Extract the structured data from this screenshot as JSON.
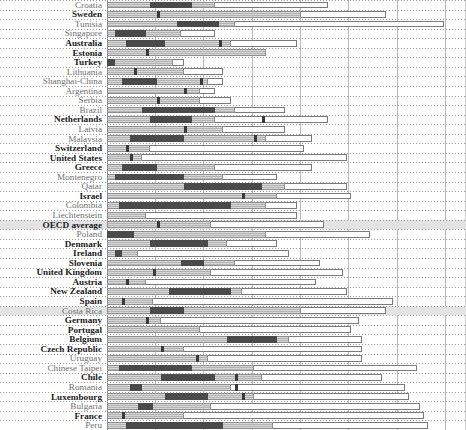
{
  "chart_data": {
    "type": "bar",
    "title": "",
    "subtitle": "",
    "xlabel": "",
    "ylabel": "",
    "orientation": "horizontal",
    "stacked": true,
    "grid": {
      "vertical": true,
      "horizontal": true
    },
    "legend": {
      "position": "none",
      "entries": []
    },
    "xlim": [
      0,
      100
    ],
    "xticks": [
      0,
      12.5,
      25,
      37.5,
      50,
      62.5,
      75,
      87.5
    ],
    "xticklabels": [
      "",
      "",
      "",
      "",
      "",
      "",
      "",
      ""
    ],
    "series": [
      {
        "name": "filled-portion",
        "color": "#b4b4b4"
      },
      {
        "name": "dark-segment",
        "color": "#4a4a4a"
      },
      {
        "name": "outlined-total",
        "color": "#ffffff"
      }
    ],
    "categories": [
      "Croatia",
      "Sweden",
      "Tunisia",
      "Singapore",
      "Australia",
      "Estonia",
      "Turkey",
      "Lithuania",
      "Shanghai-China",
      "Argentina",
      "Serbia",
      "Brazil",
      "Netherlands",
      "Latvia",
      "Malaysia",
      "Switzerland",
      "United States",
      "Greece",
      "Montenegro",
      "Qatar",
      "Israel",
      "Colombia",
      "Liechtenstein",
      "OECD average",
      "Poland",
      "Denmark",
      "Ireland",
      "Slovenia",
      "United Kingdom",
      "Austria",
      "New Zealand",
      "Spain",
      "Costa Rica",
      "Germany",
      "Portugal",
      "Belgium",
      "Czech Republic",
      "Uruguay",
      "Chinese Taipei",
      "Chile",
      "Romania",
      "Luxembourg",
      "Bulgaria",
      "France",
      "Peru"
    ],
    "rows": [
      {
        "label": "Croatia",
        "bold": false,
        "highlight": false,
        "total": 57,
        "fill": 28,
        "seg_start": 11,
        "seg_end": 22,
        "marker": null
      },
      {
        "label": "Sweden",
        "bold": true,
        "highlight": false,
        "total": 72,
        "fill": 50,
        "seg_start": 0,
        "seg_end": 0,
        "marker": 13
      },
      {
        "label": "Tunisia",
        "bold": false,
        "highlight": false,
        "total": 87,
        "fill": 33,
        "seg_start": 18,
        "seg_end": 29,
        "marker": null
      },
      {
        "label": "Singapore",
        "bold": false,
        "highlight": false,
        "total": 28,
        "fill": 19,
        "seg_start": 2,
        "seg_end": 10,
        "marker": null
      },
      {
        "label": "Australia",
        "bold": true,
        "highlight": false,
        "total": 49,
        "fill": 32,
        "seg_start": 5,
        "seg_end": 15,
        "marker": 29
      },
      {
        "label": "Estonia",
        "bold": true,
        "highlight": false,
        "total": 41,
        "fill": 41,
        "seg_start": 0,
        "seg_end": 0,
        "marker": 10
      },
      {
        "label": "Turkey",
        "bold": true,
        "highlight": false,
        "total": 20,
        "fill": 17,
        "seg_start": 0,
        "seg_end": 2,
        "marker": null
      },
      {
        "label": "Lithuania",
        "bold": false,
        "highlight": false,
        "total": 30,
        "fill": 20,
        "seg_start": 0,
        "seg_end": 0,
        "marker": 7
      },
      {
        "label": "Shanghai-China",
        "bold": false,
        "highlight": false,
        "total": 30,
        "fill": 26,
        "seg_start": 4,
        "seg_end": 13,
        "marker": 24
      },
      {
        "label": "Argentina",
        "bold": false,
        "highlight": false,
        "total": 28,
        "fill": 24,
        "seg_start": 0,
        "seg_end": 0,
        "marker": 20
      },
      {
        "label": "Serbia",
        "bold": false,
        "highlight": false,
        "total": 32,
        "fill": 24,
        "seg_start": 0,
        "seg_end": 0,
        "marker": 13
      },
      {
        "label": "Brazil",
        "bold": false,
        "highlight": false,
        "total": 46,
        "fill": 33,
        "seg_start": 9,
        "seg_end": 28,
        "marker": null
      },
      {
        "label": "Netherlands",
        "bold": true,
        "highlight": false,
        "total": 57,
        "fill": 28,
        "seg_start": 11,
        "seg_end": 22,
        "marker": 40
      },
      {
        "label": "Latvia",
        "bold": false,
        "highlight": false,
        "total": 46,
        "fill": 30,
        "seg_start": 0,
        "seg_end": 0,
        "marker": 20
      },
      {
        "label": "Malaysia",
        "bold": false,
        "highlight": false,
        "total": 53,
        "fill": 41,
        "seg_start": 6,
        "seg_end": 20,
        "marker": 38
      },
      {
        "label": "Switzerland",
        "bold": true,
        "highlight": false,
        "total": 51,
        "fill": 11,
        "seg_start": 0,
        "seg_end": 0,
        "marker": 5
      },
      {
        "label": "United States",
        "bold": true,
        "highlight": false,
        "total": 62,
        "fill": 9,
        "seg_start": 0,
        "seg_end": 0,
        "marker": 6
      },
      {
        "label": "Greece",
        "bold": true,
        "highlight": false,
        "total": 53,
        "fill": 28,
        "seg_start": 4,
        "seg_end": 13,
        "marker": null
      },
      {
        "label": "Montenegro",
        "bold": false,
        "highlight": false,
        "total": 44,
        "fill": 30,
        "seg_start": 2,
        "seg_end": 20,
        "marker": null
      },
      {
        "label": "Qatar",
        "bold": false,
        "highlight": false,
        "total": 62,
        "fill": 46,
        "seg_start": 20,
        "seg_end": 40,
        "marker": null
      },
      {
        "label": "Israel",
        "bold": true,
        "highlight": false,
        "total": 63,
        "fill": 44,
        "seg_start": 0,
        "seg_end": 0,
        "marker": 35
      },
      {
        "label": "Colombia",
        "bold": false,
        "highlight": false,
        "total": 49,
        "fill": 41,
        "seg_start": 3,
        "seg_end": 32,
        "marker": null
      },
      {
        "label": "Liechtenstein",
        "bold": false,
        "highlight": false,
        "total": 49,
        "fill": 10,
        "seg_start": 0,
        "seg_end": 0,
        "marker": null
      },
      {
        "label": "OECD average",
        "bold": true,
        "highlight": true,
        "total": 56,
        "fill": 27,
        "seg_start": 0,
        "seg_end": 0,
        "marker": 13
      },
      {
        "label": "Poland",
        "bold": false,
        "highlight": false,
        "total": 68,
        "fill": 41,
        "seg_start": 0,
        "seg_end": 7,
        "marker": null
      },
      {
        "label": "Denmark",
        "bold": true,
        "highlight": false,
        "total": 44,
        "fill": 31,
        "seg_start": 11,
        "seg_end": 26,
        "marker": null
      },
      {
        "label": "Ireland",
        "bold": true,
        "highlight": false,
        "total": 47,
        "fill": 8,
        "seg_start": 2,
        "seg_end": 4,
        "marker": null
      },
      {
        "label": "Slovenia",
        "bold": true,
        "highlight": false,
        "total": 55,
        "fill": 33,
        "seg_start": 19,
        "seg_end": 25,
        "marker": null
      },
      {
        "label": "United Kingdom",
        "bold": true,
        "highlight": false,
        "total": 61,
        "fill": 27,
        "seg_start": 0,
        "seg_end": 0,
        "marker": 12
      },
      {
        "label": "Austria",
        "bold": true,
        "highlight": false,
        "total": 54,
        "fill": 10,
        "seg_start": 0,
        "seg_end": 0,
        "marker": 5
      },
      {
        "label": "New Zealand",
        "bold": true,
        "highlight": false,
        "total": 62,
        "fill": 35,
        "seg_start": 16,
        "seg_end": 32,
        "marker": null
      },
      {
        "label": "Spain",
        "bold": true,
        "highlight": false,
        "total": 74,
        "fill": 12,
        "seg_start": 0,
        "seg_end": 0,
        "marker": 4
      },
      {
        "label": "Costa Rica",
        "bold": false,
        "highlight": true,
        "total": 72,
        "fill": 50,
        "seg_start": 11,
        "seg_end": 20,
        "marker": null
      },
      {
        "label": "Germany",
        "bold": true,
        "highlight": false,
        "total": 65,
        "fill": 14,
        "seg_start": 0,
        "seg_end": 0,
        "marker": 10
      },
      {
        "label": "Portugal",
        "bold": true,
        "highlight": false,
        "total": 63,
        "fill": 24,
        "seg_start": 0,
        "seg_end": 0,
        "marker": null
      },
      {
        "label": "Belgium",
        "bold": true,
        "highlight": false,
        "total": 66,
        "fill": 47,
        "seg_start": 31,
        "seg_end": 44,
        "marker": null
      },
      {
        "label": "Czech Republic",
        "bold": true,
        "highlight": false,
        "total": 66,
        "fill": 20,
        "seg_start": 0,
        "seg_end": 0,
        "marker": 14
      },
      {
        "label": "Uruguay",
        "bold": false,
        "highlight": false,
        "total": 66,
        "fill": 26,
        "seg_start": 0,
        "seg_end": 0,
        "marker": 23
      },
      {
        "label": "Chinese Taipei",
        "bold": false,
        "highlight": false,
        "total": 80,
        "fill": 38,
        "seg_start": 3,
        "seg_end": 22,
        "marker": null
      },
      {
        "label": "Chile",
        "bold": true,
        "highlight": false,
        "total": 71,
        "fill": 40,
        "seg_start": 14,
        "seg_end": 28,
        "marker": 33
      },
      {
        "label": "Romania",
        "bold": false,
        "highlight": false,
        "total": 77,
        "fill": 32,
        "seg_start": 6,
        "seg_end": 9,
        "marker": 33
      },
      {
        "label": "Luxembourg",
        "bold": true,
        "highlight": false,
        "total": 78,
        "fill": 38,
        "seg_start": 15,
        "seg_end": 26,
        "marker": 35
      },
      {
        "label": "Bulgaria",
        "bold": false,
        "highlight": false,
        "total": 81,
        "fill": 27,
        "seg_start": 8,
        "seg_end": 12,
        "marker": null
      },
      {
        "label": "France",
        "bold": true,
        "highlight": false,
        "total": 82,
        "fill": 20,
        "seg_start": 0,
        "seg_end": 0,
        "marker": 4
      },
      {
        "label": "Peru",
        "bold": false,
        "highlight": false,
        "total": 83,
        "fill": 43,
        "seg_start": 5,
        "seg_end": 30,
        "marker": null
      }
    ]
  },
  "colors": {
    "bar_fill": "#b4b4b4",
    "bar_dark": "#4a4a4a",
    "bar_outline": "#7a7a7a",
    "grid": "#b9b9b9",
    "row_line": "#cfcfcf",
    "highlight_row": "#e3e3e3",
    "label_bold": "#1a1a1a",
    "label_light": "#6f6f6f",
    "background": "#ffffff"
  }
}
